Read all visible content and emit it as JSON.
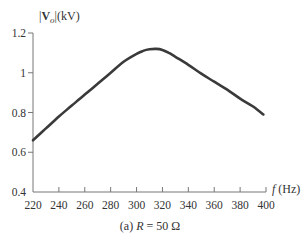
{
  "chart_data": {
    "type": "line",
    "title": "",
    "caption": {
      "prefix": "(a) ",
      "var": "R",
      "suffix": " = 50 Ω"
    },
    "xlabel": {
      "var": "f",
      "unit": " (Hz)"
    },
    "ylabel": {
      "bars_open": "|",
      "var": "V",
      "sub": "o",
      "bars_close": "|",
      "unit": "(kV)"
    },
    "xlim": [
      220,
      400
    ],
    "ylim": [
      0.4,
      1.2
    ],
    "x_ticks": [
      220,
      240,
      260,
      280,
      300,
      320,
      340,
      360,
      380,
      400
    ],
    "y_ticks": [
      {
        "value": 0.4,
        "label": "0.4"
      },
      {
        "value": 0.6,
        "label": "0.6"
      },
      {
        "value": 0.8,
        "label": "0.8"
      },
      {
        "value": 1.0,
        "label": "1"
      },
      {
        "value": 1.2,
        "label": "1.2"
      }
    ],
    "grid": false,
    "legend": null,
    "series": [
      {
        "name": "|Vo| vs f",
        "color": "#3a3a3a",
        "x": [
          220,
          230,
          240,
          250,
          260,
          270,
          280,
          290,
          300,
          305,
          310,
          315,
          320,
          325,
          330,
          340,
          350,
          360,
          370,
          380,
          390,
          398
        ],
        "values": [
          0.66,
          0.72,
          0.78,
          0.835,
          0.89,
          0.945,
          1.0,
          1.055,
          1.095,
          1.11,
          1.118,
          1.12,
          1.115,
          1.1,
          1.08,
          1.04,
          0.995,
          0.955,
          0.915,
          0.87,
          0.83,
          0.79
        ]
      }
    ]
  }
}
